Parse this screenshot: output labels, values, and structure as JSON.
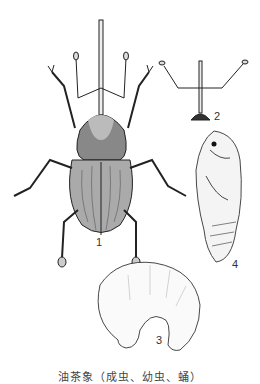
{
  "figure": {
    "panels": [
      {
        "id": "1",
        "label": "1",
        "subject": "adult weevil, dorsal view"
      },
      {
        "id": "2",
        "label": "2",
        "subject": "head and rostrum with antennae"
      },
      {
        "id": "3",
        "label": "3",
        "subject": "larva (C-shaped grub)"
      },
      {
        "id": "4",
        "label": "4",
        "subject": "pupa, lateral view"
      }
    ],
    "caption": "油茶象（成虫、幼虫、蛹）"
  }
}
